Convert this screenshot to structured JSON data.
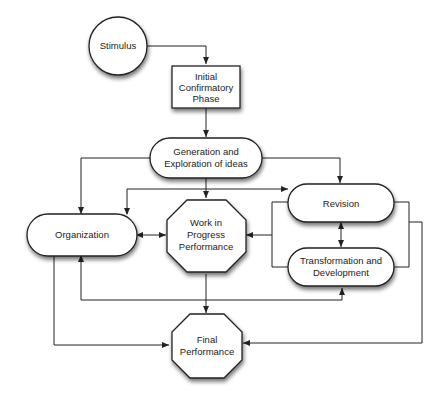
{
  "diagram": {
    "type": "flowchart",
    "nodes": {
      "stimulus": {
        "label": [
          "Stimulus"
        ],
        "shape": "circle"
      },
      "initial": {
        "label": [
          "Initial",
          "Confirmatory",
          "Phase"
        ],
        "shape": "rectangle"
      },
      "generation": {
        "label": [
          "Generation and",
          "Exploration of ideas"
        ],
        "shape": "rounded-rectangle"
      },
      "organization": {
        "label": [
          "Organization"
        ],
        "shape": "rounded-rectangle"
      },
      "wip": {
        "label": [
          "Work in",
          "Progress",
          "Performance"
        ],
        "shape": "octagon"
      },
      "revision": {
        "label": [
          "Revision"
        ],
        "shape": "rounded-rectangle"
      },
      "transformation": {
        "label": [
          "Transformation and",
          "Development"
        ],
        "shape": "rounded-rectangle"
      },
      "final": {
        "label": [
          "Final",
          "Performance"
        ],
        "shape": "octagon"
      }
    },
    "edges": [
      {
        "from": "stimulus",
        "to": "initial"
      },
      {
        "from": "initial",
        "to": "generation"
      },
      {
        "from": "generation",
        "to": "organization",
        "bidirectional": true
      },
      {
        "from": "generation",
        "to": "revision",
        "bidirectional": true
      },
      {
        "from": "generation",
        "to": "wip"
      },
      {
        "from": "organization",
        "to": "revision",
        "bidirectional": true
      },
      {
        "from": "organization",
        "to": "wip",
        "bidirectional": true
      },
      {
        "from": "revision-transformation",
        "to": "wip"
      },
      {
        "from": "revision",
        "to": "transformation",
        "bidirectional": true
      },
      {
        "from": "organization",
        "to": "transformation",
        "bidirectional": true
      },
      {
        "from": "wip",
        "to": "final"
      },
      {
        "from": "organization",
        "to": "final"
      },
      {
        "from": "revision-transformation",
        "to": "final"
      }
    ]
  }
}
